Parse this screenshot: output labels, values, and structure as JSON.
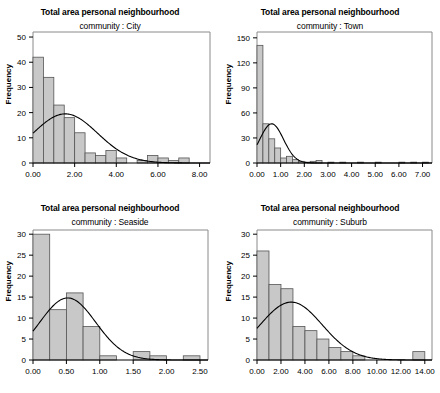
{
  "figure": {
    "background": "#ffffff",
    "bar_fill": "#c8c8c8",
    "bar_stroke": "#555555",
    "axis_color": "#000000",
    "curve_color": "#000000",
    "panel_count": 4
  },
  "chart_data": [
    {
      "type": "bar",
      "title": "Total area personal neighbourhood",
      "subtitle": "community : City",
      "xlabel": "",
      "ylabel": "Frequency",
      "grid": false,
      "legend": null,
      "xlim": [
        0.0,
        8.5
      ],
      "ylim": [
        0,
        52
      ],
      "xticks": [
        "0.00",
        "2.00",
        "4.00",
        "6.00",
        "8.00"
      ],
      "xtick_values": [
        0,
        2,
        4,
        6,
        8
      ],
      "yticks": [
        "0",
        "10",
        "20",
        "30",
        "40",
        "50"
      ],
      "ytick_values": [
        0,
        10,
        20,
        30,
        40,
        50
      ],
      "bin_width": 0.5,
      "bin_starts": [
        0.0,
        0.5,
        1.0,
        1.5,
        2.0,
        2.5,
        3.0,
        3.5,
        4.0,
        4.5,
        5.0,
        5.5,
        6.0,
        6.5,
        7.0
      ],
      "values": [
        42,
        34,
        23,
        18,
        12,
        4,
        3,
        5,
        2,
        0,
        1,
        3,
        2,
        1,
        2
      ],
      "overlay_curve": {
        "name": "normal-fit",
        "mean": 1.55,
        "sd": 1.55,
        "peak": 19.5,
        "y_at_zero": 12
      }
    },
    {
      "type": "bar",
      "title": "Total area personal neighbourhood",
      "subtitle": "community : Town",
      "xlabel": "",
      "ylabel": "Frequency",
      "grid": false,
      "legend": null,
      "xlim": [
        0.0,
        7.4
      ],
      "ylim": [
        0,
        157
      ],
      "xticks": [
        "0.00",
        "1.00",
        "2.00",
        "3.00",
        "4.00",
        "5.00",
        "6.00",
        "7.00"
      ],
      "xtick_values": [
        0,
        1,
        2,
        3,
        4,
        5,
        6,
        7
      ],
      "yticks": [
        "0",
        "30",
        "60",
        "90",
        "120",
        "150"
      ],
      "ytick_values": [
        0,
        30,
        60,
        90,
        120,
        150
      ],
      "bin_width": 0.25,
      "bin_starts": [
        0.0,
        0.25,
        0.5,
        0.75,
        1.0,
        1.25,
        1.5,
        1.75,
        2.0,
        2.25,
        2.5,
        2.75,
        3.0,
        3.25,
        3.5,
        3.75,
        4.0,
        4.25,
        4.5,
        4.75,
        5.0,
        5.25,
        5.5,
        5.75,
        6.0,
        6.25,
        6.5,
        6.75,
        7.0
      ],
      "values": [
        141,
        47,
        29,
        18,
        6,
        8,
        4,
        2,
        1,
        2,
        3,
        0,
        1,
        0,
        1,
        0,
        0,
        1,
        0,
        0,
        1,
        0,
        0,
        0,
        1,
        0,
        1,
        0,
        1
      ],
      "overlay_curve": {
        "name": "normal-fit",
        "mean": 0.62,
        "sd": 0.5,
        "peak": 47,
        "y_at_zero": 36
      }
    },
    {
      "type": "bar",
      "title": "Total area personal neighbourhood",
      "subtitle": "community : Seaside",
      "xlabel": "",
      "ylabel": "Frequency",
      "grid": false,
      "legend": null,
      "xlim": [
        0.0,
        2.62
      ],
      "ylim": [
        0,
        31
      ],
      "xticks": [
        "0.00",
        "0.50",
        "1.00",
        "1.50",
        "2.00",
        "2.50"
      ],
      "xtick_values": [
        0,
        0.5,
        1.0,
        1.5,
        2.0,
        2.5
      ],
      "yticks": [
        "0",
        "5",
        "10",
        "15",
        "20",
        "25",
        "30"
      ],
      "ytick_values": [
        0,
        5,
        10,
        15,
        20,
        25,
        30
      ],
      "bin_width": 0.25,
      "bin_starts": [
        0.0,
        0.25,
        0.5,
        0.75,
        1.0,
        1.25,
        1.5,
        1.75,
        2.0,
        2.25
      ],
      "values": [
        30,
        12,
        16,
        8,
        1,
        0,
        2,
        1,
        0,
        1
      ],
      "overlay_curve": {
        "name": "normal-fit",
        "mean": 0.52,
        "sd": 0.42,
        "peak": 14.8,
        "y_at_zero": 9.2
      }
    },
    {
      "type": "bar",
      "title": "Total area personal neighbourhood",
      "subtitle": "community : Suburb",
      "xlabel": "",
      "ylabel": "Frequency",
      "grid": false,
      "legend": null,
      "xlim": [
        0.0,
        14.6
      ],
      "ylim": [
        0,
        31
      ],
      "xticks": [
        "0.00",
        "2.00",
        "4.00",
        "6.00",
        "8.00",
        "10.00",
        "12.00",
        "14.00"
      ],
      "xtick_values": [
        0,
        2,
        4,
        6,
        8,
        10,
        12,
        14
      ],
      "yticks": [
        "0",
        "5",
        "10",
        "15",
        "20",
        "25",
        "30"
      ],
      "ytick_values": [
        0,
        5,
        10,
        15,
        20,
        25,
        30
      ],
      "bin_width": 1.0,
      "bin_starts": [
        0.0,
        1.0,
        2.0,
        3.0,
        4.0,
        5.0,
        6.0,
        7.0,
        8.0,
        9.0,
        10.0,
        11.0,
        12.0,
        13.0
      ],
      "values": [
        26,
        18,
        17,
        8,
        7,
        5,
        3,
        2,
        1,
        0,
        0,
        0,
        0,
        2
      ],
      "overlay_curve": {
        "name": "normal-fit",
        "mean": 2.85,
        "sd": 2.6,
        "peak": 13.8,
        "y_at_zero": 8.1
      }
    }
  ]
}
